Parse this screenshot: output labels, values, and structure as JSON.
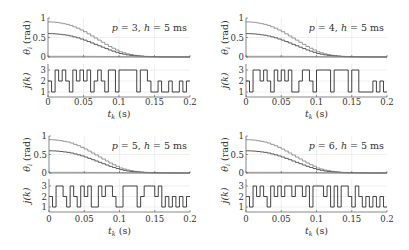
{
  "figure": {
    "panel_count": 4,
    "colors": {
      "axis": "#555555",
      "grid": "#e4e4e4",
      "theta_1": "#8a8a8a",
      "theta_2": "#4a4a4a",
      "theta_3": "#b5b5b5",
      "j_line": "#2e2e2e"
    }
  },
  "chart_data": [
    {
      "type": "line",
      "annotation": {
        "p_label": "p",
        "p_value": "3",
        "h_label": "h",
        "h_value": "5",
        "h_unit": "ms"
      },
      "top": {
        "ylabel_sym": "θ",
        "ylabel_sub": "i",
        "ylabel_unit": "(rad)",
        "ylim": [
          0,
          1
        ],
        "yticks": [
          0,
          0.5,
          1
        ],
        "ytick_labels": [
          "0",
          "0.5",
          "1"
        ],
        "series": [
          {
            "name": "theta_1",
            "values": [
              0.9,
              0.896,
              0.887,
              0.873,
              0.855,
              0.837,
              0.81,
              0.774,
              0.738,
              0.693,
              0.648,
              0.594,
              0.54,
              0.486,
              0.432,
              0.378,
              0.324,
              0.27,
              0.225,
              0.18,
              0.135,
              0.108,
              0.081,
              0.063,
              0.045,
              0.036,
              0.027,
              0.018,
              0.014,
              0.011,
              0.009,
              0.007,
              0.005,
              0.005,
              0.004,
              0.003,
              0.002,
              0.002,
              0.001,
              0.001,
              0
            ]
          },
          {
            "name": "theta_2",
            "values": [
              0.6,
              0.597,
              0.591,
              0.582,
              0.57,
              0.558,
              0.54,
              0.516,
              0.492,
              0.462,
              0.432,
              0.396,
              0.36,
              0.324,
              0.288,
              0.252,
              0.216,
              0.18,
              0.15,
              0.12,
              0.09,
              0.072,
              0.054,
              0.042,
              0.03,
              0.024,
              0.018,
              0.012,
              0.009,
              0.007,
              0.006,
              0.005,
              0.004,
              0.003,
              0.002,
              0.002,
              0.001,
              0.001,
              0.001,
              0,
              0
            ]
          },
          {
            "name": "theta_3",
            "values": [
              0.02,
              0.02,
              0.02,
              0.02,
              0.02,
              0.02,
              0.02,
              0.02,
              0.02,
              0.019,
              0.019,
              0.018,
              0.018,
              0.017,
              0.016,
              0.015,
              0.014,
              0.013,
              0.012,
              0.011,
              0.01,
              0.009,
              0.008,
              0.007,
              0.006,
              0.005,
              0.004,
              0.003,
              0.003,
              0.002,
              0.002,
              0.002,
              0.001,
              0.001,
              0.001,
              0.001,
              0,
              0,
              0,
              0,
              0
            ]
          }
        ]
      },
      "bottom": {
        "ylabel": "j(k)",
        "yticks": [
          1,
          2,
          3
        ],
        "ytick_labels": [
          "1",
          "2",
          "3"
        ],
        "j": [
          2,
          1,
          3,
          2,
          3,
          2,
          1,
          3,
          2,
          3,
          2,
          3,
          1,
          2,
          3,
          2,
          1,
          3,
          3,
          1,
          3,
          3,
          3,
          3,
          3,
          1,
          3,
          3,
          2,
          1,
          1,
          2,
          1,
          1,
          2,
          1,
          1,
          2,
          1,
          2
        ]
      },
      "x": {
        "label_sym": "t",
        "label_sub": "k",
        "label_unit": "(s)",
        "xlim": [
          0,
          0.2
        ],
        "step": 0.005,
        "xticks": [
          0,
          0.05,
          0.1,
          0.15,
          0.2
        ],
        "xtick_labels": [
          "0",
          "0.05",
          "0.1",
          "0.15",
          "0.2"
        ]
      }
    },
    {
      "type": "line",
      "annotation": {
        "p_label": "p",
        "p_value": "4",
        "h_label": "h",
        "h_value": "5",
        "h_unit": "ms"
      },
      "top": {
        "ylabel_sym": "θ",
        "ylabel_sub": "i",
        "ylabel_unit": "(rad)",
        "ylim": [
          0,
          1
        ],
        "yticks": [
          0,
          0.5,
          1
        ],
        "ytick_labels": [
          "0",
          "0.5",
          "1"
        ],
        "series": [
          {
            "name": "theta_1",
            "values": [
              0.9,
              0.896,
              0.887,
              0.873,
              0.855,
              0.837,
              0.81,
              0.774,
              0.738,
              0.693,
              0.648,
              0.594,
              0.54,
              0.486,
              0.432,
              0.378,
              0.324,
              0.27,
              0.225,
              0.18,
              0.135,
              0.108,
              0.081,
              0.063,
              0.045,
              0.036,
              0.027,
              0.018,
              0.014,
              0.011,
              0.009,
              0.007,
              0.005,
              0.005,
              0.004,
              0.003,
              0.002,
              0.002,
              0.001,
              0.001,
              0
            ]
          },
          {
            "name": "theta_2",
            "values": [
              0.6,
              0.597,
              0.591,
              0.582,
              0.57,
              0.558,
              0.54,
              0.516,
              0.492,
              0.462,
              0.432,
              0.396,
              0.36,
              0.324,
              0.288,
              0.252,
              0.216,
              0.18,
              0.15,
              0.12,
              0.09,
              0.072,
              0.054,
              0.042,
              0.03,
              0.024,
              0.018,
              0.012,
              0.009,
              0.007,
              0.006,
              0.005,
              0.004,
              0.003,
              0.002,
              0.002,
              0.001,
              0.001,
              0.001,
              0,
              0
            ]
          },
          {
            "name": "theta_3",
            "values": [
              0.02,
              0.02,
              0.02,
              0.02,
              0.02,
              0.02,
              0.02,
              0.02,
              0.02,
              0.019,
              0.019,
              0.018,
              0.018,
              0.017,
              0.016,
              0.015,
              0.014,
              0.013,
              0.012,
              0.011,
              0.01,
              0.009,
              0.008,
              0.007,
              0.006,
              0.005,
              0.004,
              0.003,
              0.003,
              0.002,
              0.002,
              0.002,
              0.001,
              0.001,
              0.001,
              0.001,
              0,
              0,
              0,
              0,
              0
            ]
          }
        ]
      },
      "bottom": {
        "ylabel": "j(k)",
        "yticks": [
          1,
          2,
          3
        ],
        "ytick_labels": [
          "1",
          "2",
          "3"
        ],
        "j": [
          2,
          1,
          3,
          3,
          2,
          3,
          2,
          1,
          3,
          2,
          3,
          2,
          3,
          1,
          1,
          2,
          3,
          3,
          2,
          1,
          3,
          3,
          3,
          3,
          1,
          3,
          3,
          3,
          3,
          1,
          3,
          3,
          1,
          1,
          1,
          1,
          2,
          1,
          2,
          1
        ]
      },
      "x": {
        "label_sym": "t",
        "label_sub": "k",
        "label_unit": "(s)",
        "xlim": [
          0,
          0.2
        ],
        "step": 0.005,
        "xticks": [
          0,
          0.05,
          0.1,
          0.15,
          0.2
        ],
        "xtick_labels": [
          "0",
          "0.05",
          "0.1",
          "0.15",
          "0.2"
        ]
      }
    },
    {
      "type": "line",
      "annotation": {
        "p_label": "p",
        "p_value": "5",
        "h_label": "h",
        "h_value": "5",
        "h_unit": "ms"
      },
      "top": {
        "ylabel_sym": "θ",
        "ylabel_sub": "i",
        "ylabel_unit": "(rad)",
        "ylim": [
          0,
          1
        ],
        "yticks": [
          0,
          0.5,
          1
        ],
        "ytick_labels": [
          "0",
          "0.5",
          "1"
        ],
        "series": [
          {
            "name": "theta_1",
            "values": [
              0.9,
              0.896,
              0.887,
              0.873,
              0.855,
              0.837,
              0.81,
              0.774,
              0.738,
              0.693,
              0.648,
              0.594,
              0.54,
              0.486,
              0.432,
              0.378,
              0.324,
              0.27,
              0.225,
              0.18,
              0.135,
              0.108,
              0.081,
              0.063,
              0.045,
              0.036,
              0.027,
              0.018,
              0.014,
              0.011,
              0.009,
              0.007,
              0.005,
              0.005,
              0.004,
              0.003,
              0.002,
              0.002,
              0.001,
              0.001,
              0
            ]
          },
          {
            "name": "theta_2",
            "values": [
              0.6,
              0.597,
              0.591,
              0.582,
              0.57,
              0.558,
              0.54,
              0.516,
              0.492,
              0.462,
              0.432,
              0.396,
              0.36,
              0.324,
              0.288,
              0.252,
              0.216,
              0.18,
              0.15,
              0.12,
              0.09,
              0.072,
              0.054,
              0.042,
              0.03,
              0.024,
              0.018,
              0.012,
              0.009,
              0.007,
              0.006,
              0.005,
              0.004,
              0.003,
              0.002,
              0.002,
              0.001,
              0.001,
              0.001,
              0,
              0
            ]
          },
          {
            "name": "theta_3",
            "values": [
              0.02,
              0.02,
              0.02,
              0.02,
              0.02,
              0.02,
              0.02,
              0.02,
              0.02,
              0.019,
              0.019,
              0.018,
              0.018,
              0.017,
              0.016,
              0.015,
              0.014,
              0.013,
              0.012,
              0.011,
              0.01,
              0.009,
              0.008,
              0.007,
              0.006,
              0.005,
              0.004,
              0.003,
              0.003,
              0.002,
              0.002,
              0.002,
              0.001,
              0.001,
              0.001,
              0.001,
              0,
              0,
              0,
              0,
              0
            ]
          }
        ]
      },
      "bottom": {
        "ylabel": "j(k)",
        "yticks": [
          1,
          2,
          3
        ],
        "ytick_labels": [
          "1",
          "2",
          "3"
        ],
        "j": [
          2,
          1,
          3,
          3,
          2,
          1,
          3,
          2,
          1,
          3,
          2,
          3,
          1,
          1,
          3,
          2,
          3,
          3,
          2,
          1,
          1,
          3,
          3,
          3,
          3,
          1,
          2,
          3,
          3,
          3,
          2,
          3,
          1,
          2,
          1,
          2,
          1,
          2,
          1,
          2
        ]
      },
      "x": {
        "label_sym": "t",
        "label_sub": "k",
        "label_unit": "(s)",
        "xlim": [
          0,
          0.2
        ],
        "step": 0.005,
        "xticks": [
          0,
          0.05,
          0.1,
          0.15,
          0.2
        ],
        "xtick_labels": [
          "0",
          "0.05",
          "0.1",
          "0.15",
          "0.2"
        ]
      }
    },
    {
      "type": "line",
      "annotation": {
        "p_label": "p",
        "p_value": "6",
        "h_label": "h",
        "h_value": "5",
        "h_unit": "ms"
      },
      "top": {
        "ylabel_sym": "θ",
        "ylabel_sub": "i",
        "ylabel_unit": "(rad)",
        "ylim": [
          0,
          1
        ],
        "yticks": [
          0,
          0.5,
          1
        ],
        "ytick_labels": [
          "0",
          "0.5",
          "1"
        ],
        "series": [
          {
            "name": "theta_1",
            "values": [
              0.9,
              0.896,
              0.887,
              0.873,
              0.855,
              0.837,
              0.81,
              0.774,
              0.738,
              0.693,
              0.648,
              0.594,
              0.54,
              0.486,
              0.432,
              0.378,
              0.324,
              0.27,
              0.225,
              0.18,
              0.135,
              0.108,
              0.081,
              0.063,
              0.045,
              0.036,
              0.027,
              0.018,
              0.014,
              0.011,
              0.009,
              0.007,
              0.005,
              0.005,
              0.004,
              0.003,
              0.002,
              0.002,
              0.001,
              0.001,
              0
            ]
          },
          {
            "name": "theta_2",
            "values": [
              0.6,
              0.597,
              0.591,
              0.582,
              0.57,
              0.558,
              0.54,
              0.516,
              0.492,
              0.462,
              0.432,
              0.396,
              0.36,
              0.324,
              0.288,
              0.252,
              0.216,
              0.18,
              0.15,
              0.12,
              0.09,
              0.072,
              0.054,
              0.042,
              0.03,
              0.024,
              0.018,
              0.012,
              0.009,
              0.007,
              0.006,
              0.005,
              0.004,
              0.003,
              0.002,
              0.002,
              0.001,
              0.001,
              0.001,
              0,
              0
            ]
          },
          {
            "name": "theta_3",
            "values": [
              0.02,
              0.02,
              0.02,
              0.02,
              0.02,
              0.02,
              0.02,
              0.02,
              0.02,
              0.019,
              0.019,
              0.018,
              0.018,
              0.017,
              0.016,
              0.015,
              0.014,
              0.013,
              0.012,
              0.011,
              0.01,
              0.009,
              0.008,
              0.007,
              0.006,
              0.005,
              0.004,
              0.003,
              0.003,
              0.002,
              0.002,
              0.002,
              0.001,
              0.001,
              0.001,
              0.001,
              0,
              0,
              0,
              0,
              0
            ]
          }
        ]
      },
      "bottom": {
        "ylabel": "j(k)",
        "yticks": [
          1,
          2,
          3
        ],
        "ytick_labels": [
          "1",
          "2",
          "3"
        ],
        "j": [
          2,
          1,
          3,
          2,
          3,
          2,
          1,
          3,
          2,
          3,
          2,
          3,
          3,
          2,
          3,
          3,
          2,
          3,
          1,
          3,
          3,
          3,
          2,
          3,
          1,
          3,
          1,
          3,
          3,
          2,
          1,
          3,
          2,
          1,
          2,
          1,
          2,
          1,
          2,
          1
        ]
      },
      "x": {
        "label_sym": "t",
        "label_sub": "k",
        "label_unit": "(s)",
        "xlim": [
          0,
          0.2
        ],
        "step": 0.005,
        "xticks": [
          0,
          0.05,
          0.1,
          0.15,
          0.2
        ],
        "xtick_labels": [
          "0",
          "0.05",
          "0.1",
          "0.15",
          "0.2"
        ]
      }
    }
  ]
}
